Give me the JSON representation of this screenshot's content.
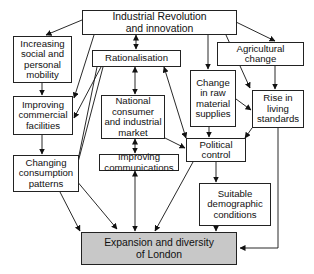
{
  "diagram": {
    "nodes": {
      "industrial": "Industrial Revolution\nand innovation",
      "social": "Increasing\nsocial and\npersonal\nmobility",
      "rationalisation": "Rationalisation",
      "agricultural": "Agricultural\nchange",
      "commercial": "Improving\ncommercial\nfacilities",
      "national": "National\nconsumer\nand industrial\nmarket",
      "raw": "Change\nin raw\nmaterial\nsupplies",
      "living": "Rise in\nliving\nstandards",
      "consumption": "Changing\nconsumption\npatterns",
      "communications": "Improving\ncommunications",
      "political": "Political\ncontrol",
      "demographic": "Suitable\ndemographic\nconditions",
      "london": "Expansion and diversity\nof London"
    },
    "edges": [
      {
        "from": "industrial",
        "to": "social"
      },
      {
        "from": "industrial",
        "to": "rationalisation",
        "bidirectional": true
      },
      {
        "from": "industrial",
        "to": "agricultural"
      },
      {
        "from": "industrial",
        "to": "raw"
      },
      {
        "from": "industrial",
        "to": "commercial"
      },
      {
        "from": "industrial",
        "to": "living"
      },
      {
        "from": "social",
        "to": "commercial"
      },
      {
        "from": "rationalisation",
        "to": "national",
        "bidirectional": true
      },
      {
        "from": "rationalisation",
        "to": "commercial"
      },
      {
        "from": "rationalisation",
        "to": "consumption"
      },
      {
        "from": "rationalisation",
        "to": "london"
      },
      {
        "from": "rationalisation",
        "to": "political",
        "bidirectional": true
      },
      {
        "from": "agricultural",
        "to": "living"
      },
      {
        "from": "agricultural",
        "to": "raw"
      },
      {
        "from": "raw",
        "to": "political"
      },
      {
        "from": "raw",
        "to": "living"
      },
      {
        "from": "commercial",
        "to": "consumption"
      },
      {
        "from": "national",
        "to": "communications",
        "bidirectional": true
      },
      {
        "from": "national",
        "to": "political"
      },
      {
        "from": "living",
        "to": "political"
      },
      {
        "from": "living",
        "to": "london"
      },
      {
        "from": "consumption",
        "to": "london"
      },
      {
        "from": "communications",
        "to": "london",
        "bidirectional": true
      },
      {
        "from": "political",
        "to": "demographic"
      },
      {
        "from": "political",
        "to": "london"
      },
      {
        "from": "demographic",
        "to": "london"
      }
    ]
  }
}
